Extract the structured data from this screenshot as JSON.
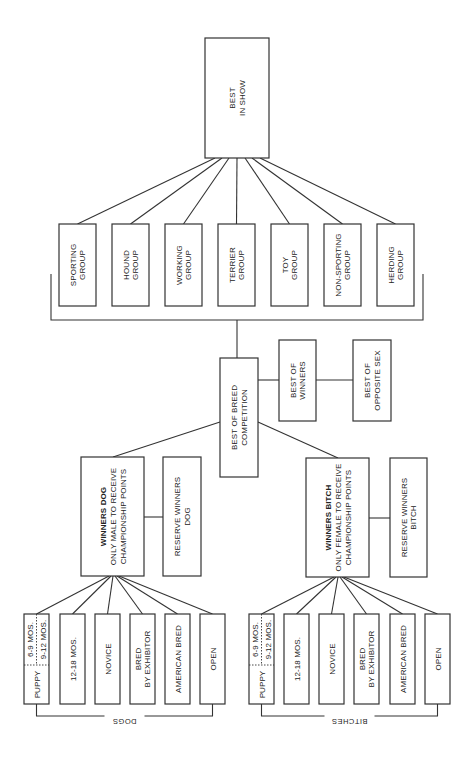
{
  "diagram": {
    "line_color": "#333333",
    "best_in_show": {
      "lines": [
        "BEST",
        "IN SHOW"
      ]
    },
    "groups": [
      {
        "id": "sporting",
        "lines": [
          "SPORTING",
          "GROUP"
        ]
      },
      {
        "id": "hound",
        "lines": [
          "HOUND",
          "GROUP"
        ]
      },
      {
        "id": "working",
        "lines": [
          "WORKING",
          "GROUP"
        ]
      },
      {
        "id": "terrier",
        "lines": [
          "TERRIER",
          "GROUP"
        ]
      },
      {
        "id": "toy",
        "lines": [
          "TOY",
          "GROUP"
        ]
      },
      {
        "id": "non-sporting",
        "lines": [
          "NON-SPORTING",
          "GROUP"
        ]
      },
      {
        "id": "herding",
        "lines": [
          "HERDING",
          "GROUP"
        ]
      }
    ],
    "best_of_breed": {
      "lines": [
        "BEST OF BREED",
        "COMPETITION"
      ]
    },
    "best_of_winners": {
      "lines": [
        "BEST OF",
        "WINNERS"
      ]
    },
    "best_of_opposite_sex": {
      "lines": [
        "BEST OF",
        "OPPOSITE SEX"
      ]
    },
    "winners_dog": {
      "title": "WINNERS DOG",
      "lines": [
        "ONLY MALE TO RECEIVE",
        "CHAMPIONSHIP POINTS"
      ]
    },
    "reserve_winners_dog": {
      "lines": [
        "RESERVE WINNERS",
        "DOG"
      ]
    },
    "winners_bitch": {
      "title": "WINNERS BITCH",
      "lines": [
        "ONLY FEMALE TO RECEIVE",
        "CHAMPIONSHIP POINTS"
      ]
    },
    "reserve_winners_bitch": {
      "lines": [
        "RESERVE WINNERS",
        "BITCH"
      ]
    },
    "puppy": {
      "label": "PUPPY",
      "sub_a": "6-9 MOS.",
      "sub_b": "9-12 MOS."
    },
    "classes": [
      {
        "id": "12-18",
        "lines": [
          "12-18 MOS."
        ]
      },
      {
        "id": "novice",
        "lines": [
          "NOVICE"
        ]
      },
      {
        "id": "bred-by-exhibitor",
        "lines": [
          "BRED",
          "BY EXHIBITOR"
        ]
      },
      {
        "id": "american-bred",
        "lines": [
          "AMERICAN BRED"
        ]
      },
      {
        "id": "open",
        "lines": [
          "OPEN"
        ]
      }
    ],
    "dogs_label": "DOGS",
    "bitches_label": "BITCHES"
  }
}
